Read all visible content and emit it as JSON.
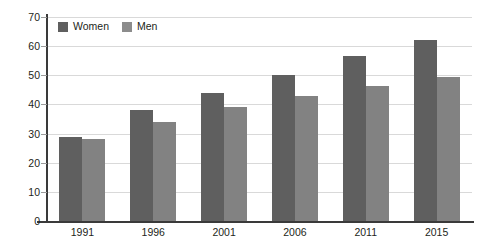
{
  "chart_data": {
    "type": "bar",
    "title": "",
    "subtitle": "",
    "xlabel": "",
    "ylabel": "",
    "categories": [
      "1991",
      "1996",
      "2001",
      "2006",
      "2011",
      "2015"
    ],
    "series": [
      {
        "name": "Women",
        "color": "#5f5f5f",
        "values": [
          29,
          38,
          44,
          50,
          56.5,
          62
        ]
      },
      {
        "name": "Men",
        "color": "#828282",
        "values": [
          28,
          34,
          39,
          43,
          46.5,
          49.5
        ]
      }
    ],
    "ylim": [
      0,
      70
    ],
    "ytick_step": 10,
    "yticks": [
      "0",
      "10",
      "20",
      "30",
      "40",
      "50",
      "60",
      "70"
    ],
    "grid": "horizontal",
    "legend_position": "top-left",
    "orientation": "vertical",
    "grouping": "grouped"
  },
  "legend": {
    "items": [
      {
        "label": "Women",
        "swatch": "legend-swatch-women"
      },
      {
        "label": "Men",
        "swatch": "legend-swatch-men"
      }
    ]
  },
  "colors": {
    "women": "#5f5f5f",
    "men": "#828282",
    "gridline": "#d9d9d9",
    "axis": "#3a3a3a",
    "text": "#231f20",
    "background": "#ffffff"
  }
}
